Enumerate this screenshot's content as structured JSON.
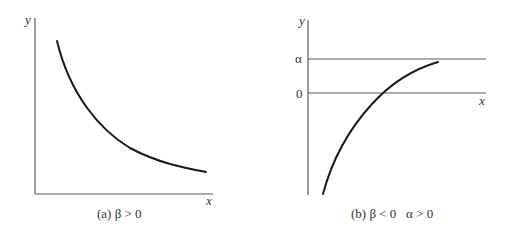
{
  "panels": [
    {
      "id": "a",
      "y_axis_label": "y",
      "x_axis_label": "x",
      "caption": "(a) β > 0",
      "curve": "decreasing convex, approaching x-axis",
      "condition": "β > 0"
    },
    {
      "id": "b",
      "y_axis_label": "y",
      "x_axis_label": "x",
      "level_labels": [
        "α",
        "0"
      ],
      "caption": "(b) β < 0   α > 0",
      "curve": "increasing concave, crossing 0 and approaching α",
      "condition": "β < 0, α > 0"
    }
  ],
  "colors": {
    "axis": "#5a5a5a",
    "curve": "#1a1a1a",
    "text": "#333333"
  }
}
